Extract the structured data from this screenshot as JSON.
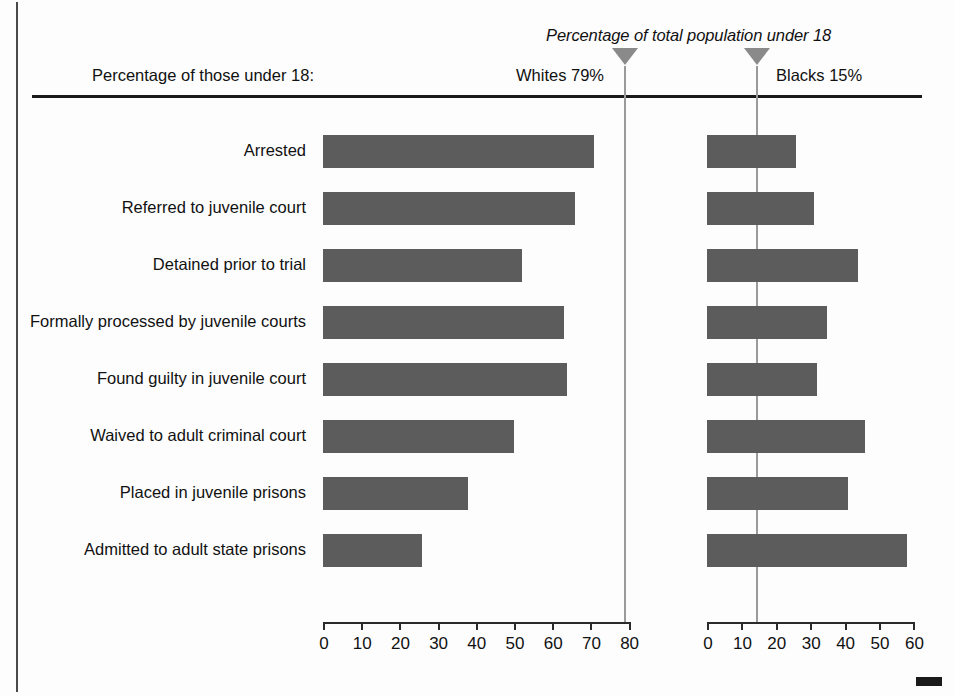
{
  "figure": {
    "top_cut_text": "",
    "left_header_label": "Percentage of those under 18:",
    "annotation": "Percentage of total population under 18",
    "whites_marker_label": "Whites 79%",
    "blacks_marker_label": "Blacks 15%"
  },
  "colors": {
    "bar": "#5c5c5c",
    "reference_line": "#9a9a9a",
    "marker_triangle": "#8a8a8a",
    "axis": "#2b2b2b",
    "text": "#111111",
    "background": "#fdfdfd"
  },
  "chart_data": {
    "type": "bar",
    "title": "",
    "subtitle": "",
    "orientation": "horizontal",
    "panels": [
      {
        "name": "Whites",
        "marker_label": "Whites 79%",
        "marker_value": 79,
        "xlabel": "",
        "ylabel": "",
        "xlim": [
          0,
          80
        ],
        "ticks": [
          0,
          10,
          20,
          30,
          40,
          50,
          60,
          70,
          80
        ],
        "grid": false,
        "values": [
          71,
          66,
          52,
          63,
          64,
          50,
          38,
          26
        ]
      },
      {
        "name": "Blacks",
        "marker_label": "Blacks 15%",
        "marker_value": 15,
        "xlabel": "",
        "ylabel": "",
        "xlim": [
          0,
          60
        ],
        "ticks": [
          0,
          10,
          20,
          30,
          40,
          50,
          60
        ],
        "grid": false,
        "values": [
          26,
          31,
          44,
          35,
          32,
          46,
          41,
          58
        ]
      }
    ],
    "categories": [
      "Arrested",
      "Referred to juvenile court",
      "Detained prior to trial",
      "Formally processed by juvenile courts",
      "Found guilty in juvenile court",
      "Waived to adult criminal court",
      "Placed in juvenile prisons",
      "Admitted to adult state prisons"
    ],
    "legend": [],
    "annotations": [
      "Percentage of total population under 18"
    ]
  }
}
